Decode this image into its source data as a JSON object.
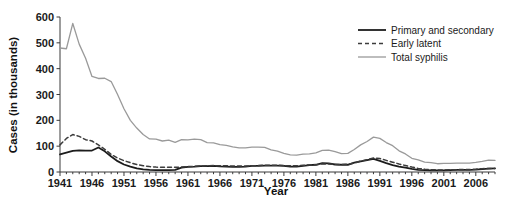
{
  "chart_data": {
    "type": "line",
    "title": "",
    "xlabel": "Year",
    "ylabel": "Cases (in thousands)",
    "xlim": [
      1941,
      2009
    ],
    "ylim": [
      0,
      600
    ],
    "yticks": [
      0,
      100,
      200,
      300,
      400,
      500,
      600
    ],
    "ytick_labels": [
      "0",
      "100",
      "200",
      "300",
      "400",
      "500",
      "600"
    ],
    "xticks": [
      1941,
      1946,
      1951,
      1956,
      1961,
      1966,
      1971,
      1976,
      1981,
      1986,
      1991,
      1996,
      2001,
      2006
    ],
    "xtick_labels": [
      "1941",
      "1946",
      "1951",
      "1956",
      "1961",
      "1966",
      "1971",
      "1976",
      "1981",
      "1986",
      "1991",
      "1996",
      "2001",
      "2006"
    ],
    "minor_xtick_interval": 1,
    "grid": false,
    "legend_position": "top-right",
    "x": [
      1941,
      1942,
      1943,
      1944,
      1945,
      1946,
      1947,
      1948,
      1949,
      1950,
      1951,
      1952,
      1953,
      1954,
      1955,
      1956,
      1957,
      1958,
      1959,
      1960,
      1961,
      1962,
      1963,
      1964,
      1965,
      1966,
      1967,
      1968,
      1969,
      1970,
      1971,
      1972,
      1973,
      1974,
      1975,
      1976,
      1977,
      1978,
      1979,
      1980,
      1981,
      1982,
      1983,
      1984,
      1985,
      1986,
      1987,
      1988,
      1989,
      1990,
      1991,
      1992,
      1993,
      1994,
      1995,
      1996,
      1997,
      1998,
      1999,
      2000,
      2001,
      2002,
      2003,
      2004,
      2005,
      2006,
      2007,
      2008,
      2009
    ],
    "series": [
      {
        "name": "Primary and secondary",
        "color": "#1c1c1c",
        "dash": "none",
        "width": 1.8,
        "values": [
          68,
          75,
          82,
          84,
          83,
          83,
          95,
          80,
          60,
          42,
          29,
          21,
          14,
          10,
          8,
          7,
          7,
          7,
          8,
          17,
          20,
          21,
          23,
          23,
          24,
          22,
          21,
          20,
          20,
          21,
          24,
          24,
          25,
          25,
          25,
          24,
          21,
          21,
          24,
          27,
          28,
          34,
          33,
          29,
          28,
          28,
          36,
          41,
          46,
          51,
          43,
          34,
          27,
          21,
          17,
          12,
          8,
          7,
          6,
          6,
          6,
          7,
          8,
          8,
          8,
          9,
          11,
          13,
          14
        ]
      },
      {
        "name": "Early latent",
        "color": "#3c3c3c",
        "dash": "4,3",
        "width": 1.5,
        "values": [
          105,
          130,
          145,
          138,
          125,
          120,
          105,
          88,
          68,
          54,
          44,
          36,
          29,
          24,
          21,
          19,
          18,
          18,
          18,
          19,
          21,
          22,
          23,
          24,
          25,
          24,
          24,
          23,
          23,
          23,
          24,
          25,
          26,
          26,
          26,
          25,
          24,
          24,
          26,
          27,
          28,
          31,
          31,
          30,
          29,
          30,
          35,
          42,
          48,
          54,
          52,
          45,
          38,
          31,
          25,
          19,
          14,
          11,
          9,
          8,
          8,
          9,
          9,
          10,
          10,
          11,
          13,
          14,
          14
        ]
      },
      {
        "name": "Total syphilis",
        "color": "#9a9a9a",
        "dash": "none",
        "width": 1.3,
        "values": [
          480,
          477,
          575,
          495,
          440,
          370,
          362,
          363,
          350,
          300,
          245,
          200,
          170,
          145,
          128,
          127,
          120,
          123,
          115,
          125,
          124,
          127,
          125,
          114,
          113,
          106,
          103,
          97,
          93,
          93,
          96,
          96,
          95,
          86,
          81,
          72,
          66,
          65,
          69,
          70,
          74,
          84,
          85,
          79,
          71,
          72,
          87,
          105,
          118,
          135,
          130,
          114,
          102,
          82,
          70,
          53,
          47,
          38,
          36,
          32,
          33,
          33,
          34,
          34,
          34,
          37,
          41,
          46,
          45
        ]
      }
    ],
    "legend": [
      {
        "label": "Primary and secondary",
        "style": "solid-dark"
      },
      {
        "label": "Early latent",
        "style": "dashed"
      },
      {
        "label": "Total syphilis",
        "style": "solid-gray"
      }
    ]
  },
  "colors": {
    "background": "#ffffff",
    "axis": "#3a3a3a",
    "text": "#1a1a1a",
    "primary_secondary": "#1c1c1c",
    "early_latent": "#3c3c3c",
    "total_syphilis": "#9a9a9a"
  }
}
